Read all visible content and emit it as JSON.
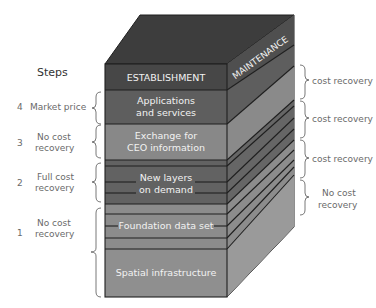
{
  "steps_title": "Steps",
  "layers": [
    {
      "name": "establishment",
      "label": "ESTABLISHMENT",
      "y1": 64,
      "y2": 90,
      "color": "#4a4a4a"
    },
    {
      "name": "applications",
      "label_line1": "Applications",
      "label_line2": "and services",
      "y1": 90,
      "y2": 124,
      "color": "#5e5e5e"
    },
    {
      "name": "exchange",
      "label_line1": "Exchange for",
      "label_line2": "CEO information",
      "y1": 124,
      "y2": 160,
      "color": "#8a8a8a"
    },
    {
      "name": "new-layers",
      "label_line1": "New layers",
      "label_line2": "on demand",
      "y1": 160,
      "y2": 204,
      "color": "#626262"
    },
    {
      "name": "foundation",
      "label": "Foundation data set",
      "y1": 204,
      "y2": 249,
      "color": "#8c8c8c"
    },
    {
      "name": "spatial",
      "label": "Spatial infrastructure",
      "y1": 249,
      "y2": 297,
      "color": "#8f8f8f"
    }
  ],
  "side_label": "MAINTENANCE",
  "left_steps": [
    {
      "number": "4",
      "line1": "Market price",
      "line2": ""
    },
    {
      "number": "3",
      "line1": "No cost",
      "line2": "recovery"
    },
    {
      "number": "2",
      "line1": "Full cost",
      "line2": "recovery"
    },
    {
      "number": "1",
      "line1": "No cost",
      "line2": "recovery"
    }
  ],
  "right_labels": [
    {
      "line1": "cost recovery",
      "line2": ""
    },
    {
      "line1": "cost recovery",
      "line2": ""
    },
    {
      "line1": "cost recovery",
      "line2": ""
    },
    {
      "line1": "No cost",
      "line2": "recovery"
    }
  ],
  "colors": {
    "top_face": "#3d3d3d",
    "side_dark": "#4f4f4f",
    "side_mid": "#6e6e6e",
    "side_light": "#8e8e8e",
    "front_dark": "#474747"
  }
}
